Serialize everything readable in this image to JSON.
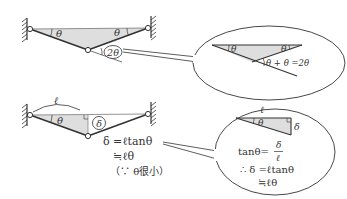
{
  "colors": {
    "line": "#333333",
    "fill": "#dedede",
    "background": "#ffffff"
  },
  "top_diagram": {
    "angle_left": "θ",
    "angle_right": "θ",
    "angle_bottom": "2θ"
  },
  "top_callout": {
    "angle_left": "θ",
    "angle_right": "θ",
    "equation": "θ + θ =2θ"
  },
  "bottom_diagram": {
    "length_label": "ℓ",
    "angle_left": "θ",
    "deflection_label": "δ",
    "eq_line1": "δ =ℓtanθ",
    "eq_line2": "≒ℓθ",
    "eq_line3": "（∵ θ很小）"
  },
  "bottom_callout": {
    "length_label": "ℓ",
    "angle_label": "θ",
    "side_label": "δ",
    "tan_lhs": "tanθ=",
    "frac_num": "δ",
    "frac_den": "ℓ",
    "line2": "∴ δ =ℓtanθ",
    "line3": "≒ℓθ"
  }
}
